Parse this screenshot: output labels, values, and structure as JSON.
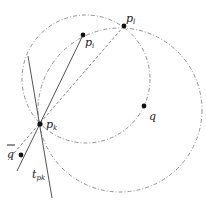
{
  "diagram": {
    "points": {
      "p_l": {
        "label": "p",
        "sub": "l",
        "x": 124,
        "y": 26
      },
      "p_i": {
        "label": "p",
        "sub": "i",
        "x": 83,
        "y": 35
      },
      "p_k": {
        "label": "p",
        "sub": "k",
        "x": 40,
        "y": 124
      },
      "q": {
        "label": "q",
        "x": 144,
        "y": 106
      },
      "q_bar": {
        "label": "q",
        "x": 21,
        "y": 155
      }
    },
    "tangent_label": {
      "label": "t",
      "sub": "pk"
    },
    "colors": {
      "line": "#555555",
      "dashed": "#777777",
      "point": "#111111"
    }
  }
}
